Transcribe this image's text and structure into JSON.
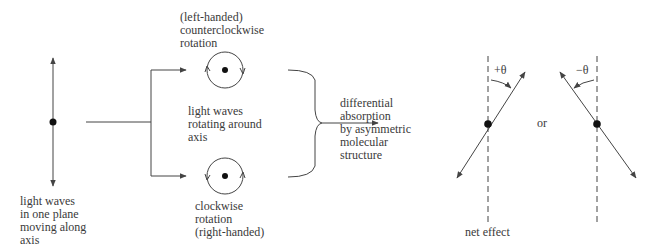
{
  "diagram": {
    "type": "optical-rotation-schematic",
    "colors": {
      "line": "#444444",
      "dot": "#111111",
      "text": "#3a3a3a",
      "background": "#ffffff"
    },
    "labels": {
      "plane_light": "light waves\nin one plane\nmoving along\naxis",
      "left_handed": "(left-handed)\ncounterclockwise\nrotation",
      "rotating": "light waves\nrotating around\naxis",
      "right_handed": "clockwise\nrotation\n(right-handed)",
      "absorption": "differential\nabsorption\nby asymmetric\nmolecular\nstructure",
      "plus_theta": "+θ",
      "minus_theta": "−θ",
      "or": "or",
      "net_effect": "net effect"
    },
    "nodes": [
      {
        "id": "plane-polarized",
        "label_ref": "plane_light"
      },
      {
        "id": "counterclockwise-circle",
        "label_ref": "left_handed"
      },
      {
        "id": "clockwise-circle",
        "label_ref": "right_handed"
      },
      {
        "id": "absorption-bracket",
        "label_ref": "absorption"
      },
      {
        "id": "net-effect-positive",
        "label_ref": "plus_theta"
      },
      {
        "id": "net-effect-negative",
        "label_ref": "minus_theta"
      }
    ]
  }
}
